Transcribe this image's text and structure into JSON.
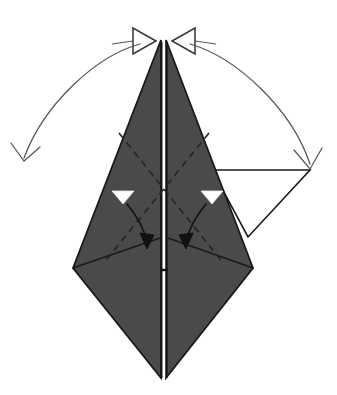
{
  "figure": {
    "type": "origami-instruction-diagram",
    "canvas": {
      "width": 337,
      "height": 395,
      "background": "#ffffff"
    }
  },
  "colors": {
    "paper_shaded": "#4a4a4a",
    "paper_white": "#ffffff",
    "outline": "#1a1a1a",
    "fold_line": "#262626",
    "arrow_stroke": "#555555",
    "marker_fill": "#ffffff"
  },
  "shapes": {
    "main_body": {
      "name": "shaded-kite-body",
      "apex": [
        163,
        38
      ],
      "left_point": [
        73,
        268
      ],
      "right_point": [
        253,
        268
      ],
      "bottom": [
        163,
        378
      ],
      "description": "Dark shaded kite / diamond shaped folded paper"
    },
    "center_slit": {
      "name": "center-vertical-slit",
      "top": [
        163,
        38
      ],
      "bottom": [
        163,
        378
      ],
      "description": "White vertical gap running down the center spine"
    },
    "white_flap": {
      "name": "white-triangle-flap",
      "points": [
        [
          212,
          170
        ],
        [
          310,
          170
        ],
        [
          248,
          237
        ]
      ],
      "description": "White unfolded triangular flap on the right side"
    }
  },
  "fold_lines": [
    {
      "name": "valley-fold-left-diagonal",
      "style": "dashed",
      "from": [
        118,
        134
      ],
      "to": [
        222,
        262
      ]
    },
    {
      "name": "valley-fold-right-diagonal",
      "style": "dashed",
      "from": [
        208,
        134
      ],
      "to": [
        104,
        262
      ]
    },
    {
      "name": "crease-left-horizontal",
      "style": "solid",
      "from": [
        73,
        268
      ],
      "to": [
        160,
        237
      ]
    },
    {
      "name": "crease-right-horizontal",
      "style": "solid",
      "from": [
        253,
        268
      ],
      "to": [
        166,
        237
      ]
    }
  ],
  "arrows": {
    "top_pinch": {
      "name": "pinch-arrowheads",
      "count": 2,
      "style": "hollow-triangle",
      "direction": "inward-to-apex",
      "left_tip": [
        155,
        40
      ],
      "right_tip": [
        171,
        40
      ],
      "label": "pinch together at apex"
    },
    "swing_left": {
      "name": "swing-arc-left",
      "style": "curved-open-arrowhead",
      "start": [
        160,
        40
      ],
      "end": [
        22,
        160
      ],
      "direction": "counter-clockwise-down-left",
      "label": "swing flap down to the left"
    },
    "swing_right": {
      "name": "swing-arc-right",
      "style": "curved-open-arrowhead",
      "start": [
        170,
        40
      ],
      "end": [
        310,
        170
      ],
      "direction": "clockwise-down-right",
      "label": "swing flap down to the right"
    },
    "fold_left": {
      "name": "fold-arrow-left",
      "style": "curved-solid-arrowhead",
      "marker_triangle": [
        122,
        197
      ],
      "start": [
        128,
        205
      ],
      "end": [
        148,
        245
      ],
      "label": "fold left flap down"
    },
    "fold_right": {
      "name": "fold-arrow-right",
      "style": "curved-solid-arrowhead",
      "marker_triangle": [
        211,
        197
      ],
      "start": [
        205,
        205
      ],
      "end": [
        185,
        245
      ],
      "label": "fold right flap down"
    }
  },
  "markers": [
    {
      "name": "white-triangle-marker-left",
      "shape": "down-triangle",
      "fill": "#ffffff",
      "x": 122,
      "y": 197
    },
    {
      "name": "white-triangle-marker-right",
      "shape": "down-triangle",
      "fill": "#ffffff",
      "x": 211,
      "y": 197
    }
  ]
}
